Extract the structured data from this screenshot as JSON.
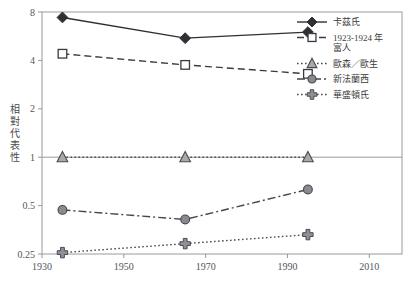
{
  "chart_data": {
    "type": "line",
    "title": "",
    "xlabel": "",
    "ylabel": "相對代表性",
    "ylabel_chars": [
      "相",
      "對",
      "代",
      "表",
      "性"
    ],
    "xlim": [
      1930,
      2018
    ],
    "ylim": [
      0.25,
      8
    ],
    "yscale": "log",
    "xticks": [
      1930,
      1950,
      1970,
      1990,
      2010
    ],
    "xtick_labels": [
      "1930",
      "1950",
      "1970",
      "1990",
      "2010"
    ],
    "yticks": [
      0.25,
      0.5,
      1,
      2,
      4,
      8
    ],
    "ytick_labels": [
      "0.25",
      "0.5",
      "1",
      "2",
      "4",
      "8"
    ],
    "grid": false,
    "reference_line": 1,
    "legend_position": "right",
    "x": [
      1935,
      1965,
      1995
    ],
    "series": [
      {
        "name": "卡茲氏",
        "marker": "filled-diamond",
        "linestyle": "solid",
        "color": "#2f2f35",
        "values": [
          7.4,
          5.5,
          6.0
        ]
      },
      {
        "name": "1923-1924 年富人",
        "name_line1": "1923-1924 年",
        "name_line2": "富人",
        "marker": "open-square",
        "linestyle": "dashed",
        "color": "#3a3a40",
        "values": [
          4.4,
          3.75,
          3.3
        ]
      },
      {
        "name": "歐森／歐生",
        "marker": "gray-triangle",
        "linestyle": "dotted",
        "color": "#4a4a50",
        "marker_fill": "#a9a9ad",
        "values": [
          1.0,
          1.0,
          1.0
        ]
      },
      {
        "name": "新法蘭西",
        "marker": "gray-circle",
        "linestyle": "dashdot",
        "color": "#45454b",
        "marker_fill": "#8a8a90",
        "values": [
          0.47,
          0.41,
          0.63
        ]
      },
      {
        "name": "華盛頓氏",
        "marker": "cross",
        "linestyle": "dotted",
        "color": "#4a4a50",
        "marker_fill": "#8f8f95",
        "values": [
          0.255,
          0.29,
          0.33
        ]
      }
    ]
  },
  "colors": {
    "background": "#ffffff",
    "frame": "#9a9a9e",
    "text": "#3a3a3a",
    "reference_line": "#9a9a9e"
  }
}
